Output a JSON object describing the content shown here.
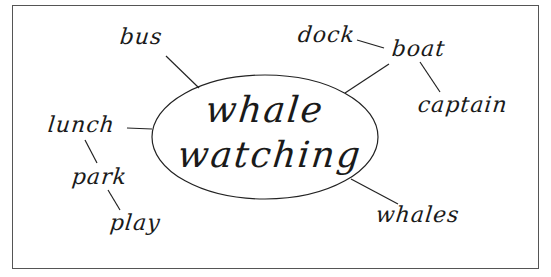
{
  "diagram": {
    "type": "mind-map",
    "center": {
      "line1": "whale",
      "line2": "watching"
    },
    "nodes": [
      {
        "id": "bus",
        "label": "bus",
        "parent": "center"
      },
      {
        "id": "boat",
        "label": "boat",
        "parent": "center"
      },
      {
        "id": "dock",
        "label": "dock",
        "parent": "boat"
      },
      {
        "id": "captain",
        "label": "captain",
        "parent": "boat"
      },
      {
        "id": "lunch",
        "label": "lunch",
        "parent": "center"
      },
      {
        "id": "park",
        "label": "park",
        "parent": "lunch"
      },
      {
        "id": "play",
        "label": "play",
        "parent": "park"
      },
      {
        "id": "whales",
        "label": "whales",
        "parent": "center"
      }
    ],
    "colors": {
      "ink": "#1a1a1a",
      "border": "#555555",
      "background": "#ffffff"
    }
  }
}
